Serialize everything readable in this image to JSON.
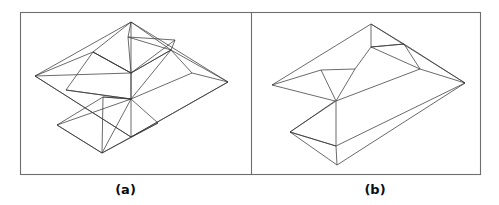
{
  "figure": {
    "background_color": "#ffffff",
    "frame": {
      "stroke_color": "#6e6e6e",
      "x": 20,
      "y": 12,
      "width": 460,
      "height": 162,
      "divider_x": 251
    },
    "line_color": "#3a3a3a",
    "panels": [
      {
        "id": "panel-a",
        "caption": "(a)",
        "description": "wireframe polyhedral surface with interior triangulation edges",
        "paths": [
          "M 131,22 L 35,76 L 131,137 L 228,82 Z",
          "M 131,22 L 131,137",
          "M 131,22 L 93,52 L 131,73 L 171,50 Z",
          "M 131,22 L 128,37 L 171,50",
          "M 128,37 L 175,40 L 171,50",
          "M 128,37 L 131,73",
          "M 175,40 L 131,73",
          "M 93,52 L 131,73 L 171,50",
          "M 131,73 L 93,52",
          "M 93,52 L 66,90 L 131,99",
          "M 131,73 L 131,99",
          "M 171,50 L 131,99",
          "M 171,50 L 192,73 L 131,99",
          "M 131,99 L 66,90",
          "M 131,99 L 103,97 L 57,125 L 102,153 L 131,137",
          "M 103,97 L 131,99",
          "M 131,99 L 158,123 L 131,137",
          "M 158,123 L 102,153",
          "M 57,125 L 102,153",
          "M 131,99 L 57,125",
          "M 103,97 L 102,153",
          "M 131,99 L 102,153",
          "M 35,76 L 131,73",
          "M 228,82 L 171,50",
          "M 228,82 L 192,73",
          "M 35,76 L 93,52",
          "M 131,137 L 228,82",
          "M 35,76 L 131,137"
        ]
      },
      {
        "id": "panel-b",
        "caption": "(b)",
        "description": "folded polyhedral surface with zigzag crease, fewer interior edges",
        "paths": [
          "M 371,24 L 272,85 L 335,101 L 290,132 L 336,146 L 336,101",
          "M 371,24 L 371,47",
          "M 371,47 L 404,44 L 371,24",
          "M 371,47 L 404,44",
          "M 404,44 L 420,69",
          "M 371,47 L 420,69",
          "M 404,44 L 465,83",
          "M 420,69 L 465,83",
          "M 371,24 L 465,83",
          "M 272,85 L 321,70 L 336,101",
          "M 321,70 L 355,69 L 336,101",
          "M 355,69 L 371,47",
          "M 336,101 L 420,69",
          "M 290,132 L 336,101",
          "M 290,132 L 336,146",
          "M 290,132 L 337,165 L 336,146",
          "M 336,146 L 465,83",
          "M 337,165 L 465,83"
        ]
      }
    ]
  }
}
